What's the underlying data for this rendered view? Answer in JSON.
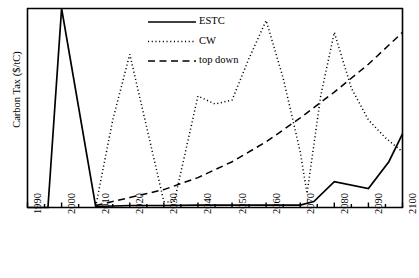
{
  "chart_data": {
    "type": "line",
    "title": "",
    "xlabel": "",
    "ylabel": "Carbon Tax ($/tC)",
    "xlim": [
      1990,
      2100
    ],
    "ylim": [
      0,
      100
    ],
    "grid": false,
    "legend_position": "top-center",
    "xticks": [
      "1990",
      "2000",
      "2010",
      "2020",
      "2030",
      "2040",
      "2050",
      "2060",
      "2070",
      "2080",
      "2090",
      "2100"
    ],
    "xtick_values": [
      1990,
      2000,
      2010,
      2020,
      2030,
      2040,
      2050,
      2060,
      2070,
      2080,
      2090,
      2100
    ],
    "minor_xtick_values": [
      1995,
      2005,
      2015,
      2025,
      2035,
      2045,
      2055,
      2065,
      2075,
      2085,
      2095
    ],
    "yticks": [],
    "ytick_labels": [],
    "series": [
      {
        "name": "ESTC",
        "style": "solid",
        "color": "#000000",
        "x": [
          1990,
          1996,
          2000,
          2010,
          2020,
          2030,
          2040,
          2050,
          2060,
          2070,
          2074,
          2080,
          2090,
          2096,
          2100
        ],
        "values": [
          0,
          0,
          100,
          0.5,
          1,
          1,
          1.2,
          1.2,
          1.2,
          1.2,
          3,
          13,
          9.5,
          23,
          37
        ]
      },
      {
        "name": "CW",
        "style": "dotted",
        "color": "#000000",
        "x": [
          2010,
          2015,
          2020,
          2025,
          2030,
          2033,
          2040,
          2045,
          2050,
          2055,
          2060,
          2065,
          2070,
          2072,
          2076,
          2080,
          2085,
          2090,
          2095,
          2100
        ],
        "values": [
          0.5,
          44,
          77,
          40,
          3,
          2.5,
          56,
          52,
          54,
          75,
          94,
          65,
          28,
          7,
          56,
          88,
          60,
          44,
          35,
          28
        ]
      },
      {
        "name": "top down",
        "style": "dashed",
        "color": "#000000",
        "x": [
          2010,
          2020,
          2030,
          2040,
          2050,
          2060,
          2070,
          2080,
          2090,
          2100
        ],
        "values": [
          1,
          5,
          9,
          15,
          23,
          33,
          45,
          58,
          72,
          88
        ]
      }
    ]
  },
  "legend": {
    "items": [
      {
        "label": "ESTC",
        "style": "solid"
      },
      {
        "label": "CW",
        "style": "dotted"
      },
      {
        "label": "top down",
        "style": "dashed"
      }
    ]
  },
  "axis": {
    "y_title": "Carbon Tax ($/tC)"
  }
}
